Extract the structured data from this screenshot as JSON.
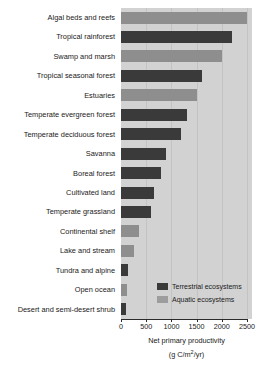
{
  "chart_data": {
    "type": "bar",
    "orientation": "horizontal",
    "title": "",
    "xlabel": "Net primary productivity",
    "xunit": "(g C/m2/yr)",
    "ylabel": "",
    "xlim": [
      0,
      2600
    ],
    "grid": true,
    "grid_axis": "x",
    "legend_position": "inside-bottom-right",
    "categories": [
      "Algal beds and reefs",
      "Tropical rainforest",
      "Swamp and marsh",
      "Tropical seasonal forest",
      "Estuaries",
      "Temperate evergreen forest",
      "Temperate deciduous forest",
      "Savanna",
      "Boreal forest",
      "Cultivated land",
      "Temperate grassland",
      "Continental shelf",
      "Lake and stream",
      "Tundra and alpine",
      "Open ocean",
      "Desert and semi-desert shrub"
    ],
    "values": [
      2500,
      2200,
      2000,
      1600,
      1500,
      1300,
      1200,
      900,
      800,
      650,
      600,
      360,
      250,
      140,
      125,
      90
    ],
    "groups": [
      "aquatic",
      "terrestrial",
      "aquatic",
      "terrestrial",
      "aquatic",
      "terrestrial",
      "terrestrial",
      "terrestrial",
      "terrestrial",
      "terrestrial",
      "terrestrial",
      "aquatic",
      "aquatic",
      "terrestrial",
      "aquatic",
      "terrestrial"
    ],
    "xticks": [
      0,
      500,
      1000,
      1500,
      2000,
      2500
    ],
    "xticklabels": [
      "0",
      "500",
      "1000",
      "1500",
      "2000",
      "2500"
    ],
    "series": [
      {
        "name": "Terrestrial ecosystems",
        "color": "#3a3a3a",
        "points": [
          {
            "category": "Tropical rainforest",
            "value": 2200
          },
          {
            "category": "Tropical seasonal forest",
            "value": 1600
          },
          {
            "category": "Temperate evergreen forest",
            "value": 1300
          },
          {
            "category": "Temperate deciduous forest",
            "value": 1200
          },
          {
            "category": "Savanna",
            "value": 900
          },
          {
            "category": "Boreal forest",
            "value": 800
          },
          {
            "category": "Cultivated land",
            "value": 650
          },
          {
            "category": "Temperate grassland",
            "value": 600
          },
          {
            "category": "Tundra and alpine",
            "value": 140
          },
          {
            "category": "Desert and semi-desert shrub",
            "value": 90
          }
        ]
      },
      {
        "name": "Aquatic ecosystems",
        "color": "#8e8e8e",
        "points": [
          {
            "category": "Algal beds and reefs",
            "value": 2500
          },
          {
            "category": "Swamp and marsh",
            "value": 2000
          },
          {
            "category": "Estuaries",
            "value": 1500
          },
          {
            "category": "Continental shelf",
            "value": 360
          },
          {
            "category": "Lake and stream",
            "value": 250
          },
          {
            "category": "Open ocean",
            "value": 125
          }
        ]
      }
    ]
  },
  "legend": {
    "items": [
      {
        "label": "Terrestrial ecosystems",
        "group": "terrestrial"
      },
      {
        "label": "Aquatic ecosystems",
        "group": "aquatic"
      }
    ]
  },
  "colors": {
    "terrestrial": "#3a3a3a",
    "aquatic": "#8e8e8e",
    "plot_background": "#d2d2d2",
    "gridline": "#c3c3c3",
    "axis": "#2b2b2b",
    "text": "#1a1a1a"
  }
}
